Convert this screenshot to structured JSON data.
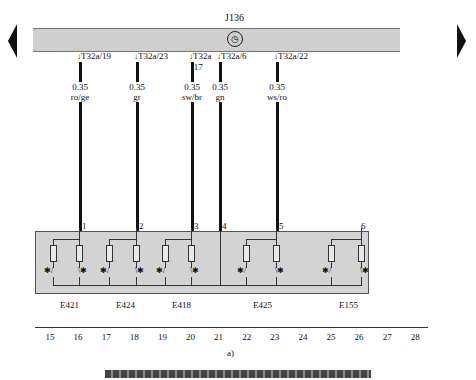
{
  "diagram": {
    "ecu": {
      "label": "J136",
      "icon": "clock-icon",
      "symbol": "◷"
    },
    "nav": {
      "left": "previous-page",
      "right": "next-page"
    },
    "wires": [
      {
        "pin": "T32a/19",
        "gauge": "0.35",
        "color": "ro/ge",
        "terminal": "1",
        "x": 79
      },
      {
        "pin": "T32a/23",
        "gauge": "0.35",
        "color": "gr",
        "terminal": "2",
        "x": 136
      },
      {
        "pin": "T32a /17",
        "gauge": "0.35",
        "color": "sw/br",
        "terminal": "3",
        "x": 191
      },
      {
        "pin": "T32a/6",
        "gauge": "0.35",
        "color": "gn",
        "terminal": "4",
        "x": 219
      },
      {
        "pin": "T32a/22",
        "gauge": "0.35",
        "color": "ws/ro",
        "terminal": "5",
        "x": 276
      }
    ],
    "extra_terminal": {
      "label": "6",
      "x": 361
    },
    "components": [
      {
        "label": "E421",
        "x": 60
      },
      {
        "label": "E424",
        "x": 116
      },
      {
        "label": "E418",
        "x": 172
      },
      {
        "label": "E425",
        "x": 253
      },
      {
        "label": "E155",
        "x": 339
      }
    ],
    "ruler": [
      "15",
      "16",
      "17",
      "18",
      "19",
      "20",
      "21",
      "22",
      "23",
      "24",
      "25",
      "26",
      "27",
      "28"
    ],
    "figure_label": "a)"
  }
}
